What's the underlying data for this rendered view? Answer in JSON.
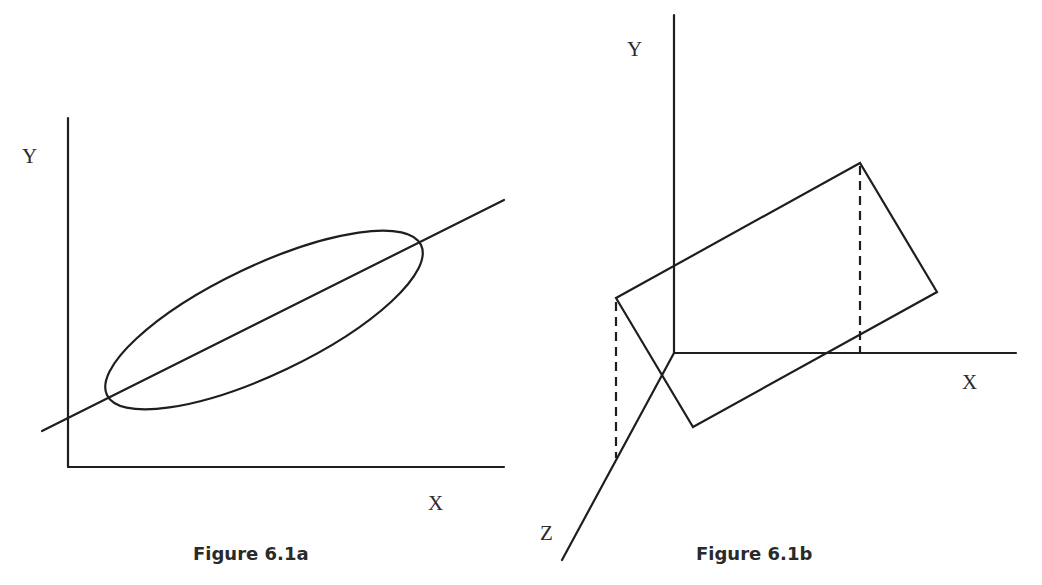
{
  "figures": [
    {
      "id": "a",
      "caption": "Figure 6.1a",
      "labels": {
        "y": "Y",
        "x": "X"
      },
      "description": "2D scatter ellipse with regression line"
    },
    {
      "id": "b",
      "caption": "Figure 6.1b",
      "labels": {
        "y": "Y",
        "x": "X",
        "z": "Z"
      },
      "description": "3D axes with tilted regression plane and dashed projection lines"
    }
  ],
  "colors": {
    "ink": "#1e1e1e",
    "text": "#2a2a2a",
    "background": "#ffffff"
  }
}
